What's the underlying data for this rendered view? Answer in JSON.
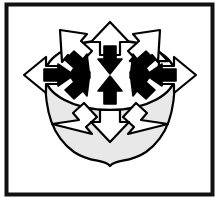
{
  "figure": {
    "caption_ghost": "",
    "frame": {
      "border_color": "#111111",
      "border_width_px": 4,
      "background_color": "#ffffff",
      "margin_color": "#ffffff"
    },
    "palette": {
      "outline": "#000000",
      "outward_arrow_fill": "#ffffff",
      "inward_arrow_fill": "#000000",
      "body_top_fill": "#ffffff",
      "body_shadow_fill": "#e8e8e8",
      "page_background": "#ffffff"
    },
    "shapes": {
      "ellipse": {
        "name": "central-ellipse",
        "cx": 110,
        "cy": 75,
        "rx": 65,
        "ry": 35
      },
      "teardrop": {
        "name": "teardrop-body",
        "tip_x": 110,
        "tip_y": 166,
        "description": "gray shaded bowl below ellipse ending in a downward point"
      }
    },
    "arrows": {
      "outward_count": 8,
      "inward_count": 8,
      "outward_label": "outward arrow (white, outline)",
      "inward_label": "inward arrow (solid black)",
      "directions": [
        {
          "name": "north",
          "angle_deg": 270,
          "outward": "up",
          "inward": "down"
        },
        {
          "name": "northeast",
          "angle_deg": 315,
          "outward": "up-right",
          "inward": "down-left"
        },
        {
          "name": "east",
          "angle_deg": 0,
          "outward": "right",
          "inward": "left"
        },
        {
          "name": "southeast",
          "angle_deg": 45,
          "outward": "down-right",
          "inward": "up-left"
        },
        {
          "name": "south",
          "angle_deg": 90,
          "outward": "down",
          "inward": "up"
        },
        {
          "name": "southwest",
          "angle_deg": 135,
          "outward": "down-left",
          "inward": "up-right"
        },
        {
          "name": "west",
          "angle_deg": 180,
          "outward": "left",
          "inward": "right"
        },
        {
          "name": "northwest",
          "angle_deg": 225,
          "outward": "up-left",
          "inward": "down-right"
        }
      ]
    }
  }
}
